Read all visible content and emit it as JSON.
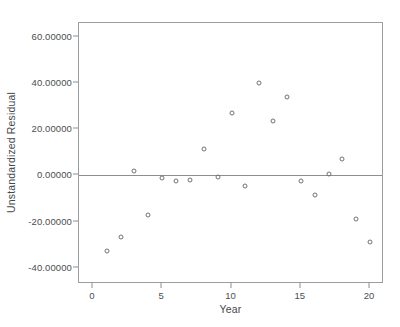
{
  "chart_data": {
    "type": "scatter",
    "title": "",
    "xlabel": "Year",
    "ylabel": "Unstandardized Residual",
    "xlim": [
      -1,
      21
    ],
    "ylim": [
      -47,
      66
    ],
    "grid": false,
    "legend": null,
    "marker": "open-circle",
    "reference_lines": [
      {
        "axis": "y",
        "value": 0
      }
    ],
    "xticks": [
      0,
      5,
      10,
      15,
      20
    ],
    "xtick_labels": [
      "0",
      "5",
      "10",
      "15",
      "20"
    ],
    "yticks": [
      60,
      40,
      20,
      0,
      -20,
      -40
    ],
    "ytick_labels": [
      "60.00000",
      "40.00000",
      "20.00000",
      "0.00000",
      "-20.00000",
      "-40.00000"
    ],
    "x": [
      1,
      2,
      3,
      4,
      5,
      6,
      7,
      8,
      9,
      10,
      11,
      12,
      13,
      14,
      15,
      16,
      17,
      18,
      19,
      20
    ],
    "y": [
      -32.5,
      -26.5,
      2.0,
      -17.0,
      -1.0,
      -2.5,
      -2.0,
      11.5,
      -0.5,
      27.0,
      -4.5,
      40.0,
      23.5,
      34.0,
      -2.5,
      -8.5,
      0.5,
      7.0,
      -19.0,
      -29.0
    ],
    "points": [
      {
        "x": 1,
        "y": -32.5
      },
      {
        "x": 2,
        "y": -26.5
      },
      {
        "x": 3,
        "y": 2.0
      },
      {
        "x": 4,
        "y": -17.0
      },
      {
        "x": 5,
        "y": -1.0
      },
      {
        "x": 6,
        "y": -2.5
      },
      {
        "x": 7,
        "y": -2.0
      },
      {
        "x": 8,
        "y": 11.5
      },
      {
        "x": 9,
        "y": -0.5
      },
      {
        "x": 10,
        "y": 27.0
      },
      {
        "x": 11,
        "y": -4.5
      },
      {
        "x": 12,
        "y": 40.0
      },
      {
        "x": 13,
        "y": 23.5
      },
      {
        "x": 14,
        "y": 34.0
      },
      {
        "x": 15,
        "y": -2.5
      },
      {
        "x": 16,
        "y": -8.5
      },
      {
        "x": 17,
        "y": 0.5
      },
      {
        "x": 18,
        "y": 7.0
      },
      {
        "x": 19,
        "y": -19.0
      },
      {
        "x": 20,
        "y": -29.0
      }
    ]
  },
  "colors": {
    "marker_stroke": "#6e7276",
    "axis": "#9a9ea1",
    "zero_line": "#8b8f92",
    "text": "#44484b",
    "background": "#ffffff"
  }
}
